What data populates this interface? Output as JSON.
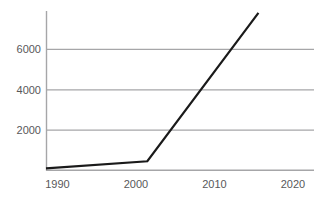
{
  "chart_data": {
    "type": "line",
    "title": "",
    "subtitle": "",
    "xlabel": "",
    "ylabel": "",
    "legend": [],
    "legend_position": "none",
    "grid": {
      "horizontal": true,
      "vertical": false,
      "color": "#a6a6a8"
    },
    "axes": {
      "x_axis_line": true,
      "y_axis_line": true,
      "axis_color": "#a6a6a8",
      "xlim": [
        1988.6,
        2021.4
      ],
      "ylim": [
        0,
        7850
      ],
      "x_ticks": [
        1990,
        2000,
        2010,
        2020
      ],
      "x_tick_labels": [
        "1990",
        "2000",
        "2010",
        "2020"
      ],
      "y_ticks": [
        2000,
        4000,
        6000
      ],
      "y_tick_labels": [
        "2000",
        "4000",
        "6000"
      ]
    },
    "series": [
      {
        "name": "series-1",
        "color": "#1a1a1a",
        "line_width": 2.2,
        "markers": false,
        "x": [
          1988.6,
          2001.0,
          2014.6
        ],
        "values": [
          100,
          450,
          7850
        ]
      }
    ]
  },
  "colors": {
    "background": "#ffffff",
    "grid": "#a6a6a8",
    "axis": "#a6a6a8",
    "line": "#1a1a1a",
    "tick_text": "#58585a"
  }
}
